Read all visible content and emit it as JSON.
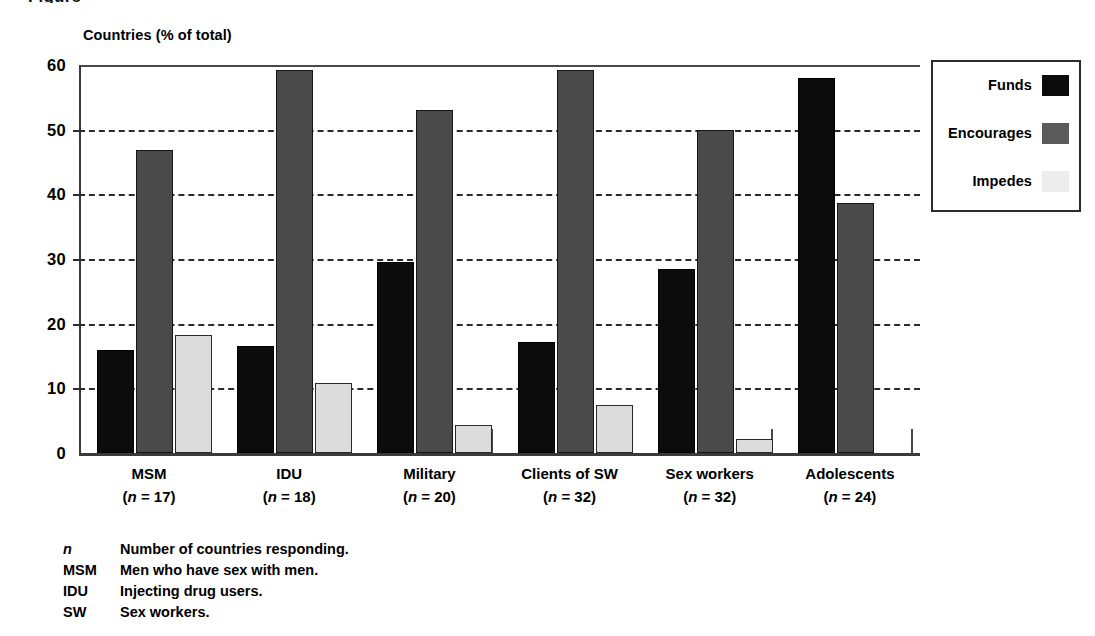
{
  "page": {
    "clipped_title": "Figure"
  },
  "chart_data": {
    "type": "bar",
    "title": "",
    "ylabel": "Countries (% of total)",
    "xlabel": "",
    "ylim": [
      0,
      60
    ],
    "yticks": [
      0,
      10,
      20,
      30,
      40,
      50,
      60
    ],
    "grid": true,
    "legend_position": "top-right",
    "categories": [
      "MSM",
      "IDU",
      "Military",
      "Clients of SW",
      "Sex workers",
      "Adolescents"
    ],
    "category_notes": [
      "(n = 17)",
      "(n = 18)",
      "(n = 20)",
      "(n = 32)",
      "(n = 32)",
      "(n = 24)"
    ],
    "series": [
      {
        "name": "Funds",
        "color": "#0c0c0c",
        "values": [
          16.0,
          16.5,
          29.5,
          17.2,
          28.4,
          58.0
        ]
      },
      {
        "name": "Encourages",
        "color": "#4a4a4a",
        "values": [
          46.8,
          59.2,
          53.0,
          59.2,
          50.0,
          38.6
        ]
      },
      {
        "name": "Impedes",
        "color": "#dcdcdc",
        "values": [
          18.2,
          10.9,
          4.3,
          7.4,
          2.2,
          0
        ]
      }
    ]
  },
  "legend": {
    "items": [
      {
        "label": "Funds"
      },
      {
        "label": "Encourages"
      },
      {
        "label": "Impedes"
      }
    ]
  },
  "footnotes": [
    {
      "key": "n",
      "italic": true,
      "text": "Number of countries responding."
    },
    {
      "key": "MSM",
      "italic": false,
      "text": "Men who have sex with men."
    },
    {
      "key": "IDU",
      "italic": false,
      "text": "Injecting drug users."
    },
    {
      "key": "SW",
      "italic": false,
      "text": "Sex workers."
    }
  ]
}
